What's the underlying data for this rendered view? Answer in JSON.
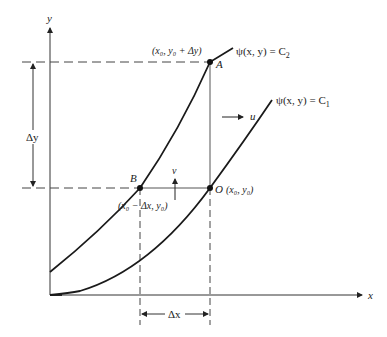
{
  "axes": {
    "x_label": "x",
    "y_label": "y"
  },
  "curves": {
    "c2_label": "ψ(x, y) = C",
    "c2_sub": "2",
    "c1_label": "ψ(x, y) = C",
    "c1_sub": "1"
  },
  "points": {
    "A": {
      "name": "A",
      "coords": "(x₀, y₀ + Δy)"
    },
    "B": {
      "name": "B",
      "coords": "(x₀ − Δx, y₀)"
    },
    "O": {
      "name": "O",
      "coords": "(x₀, y₀)"
    }
  },
  "velocities": {
    "u": "u",
    "v": "v"
  },
  "dimensions": {
    "dy": "Δy",
    "dx": "Δx"
  },
  "colors": {
    "ink": "#222222",
    "guide": "#555555"
  }
}
